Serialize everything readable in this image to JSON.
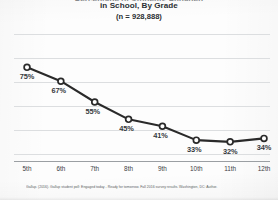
{
  "chart_data": {
    "type": "line",
    "title": "Percentage of Students Engaged in School, By Grade",
    "title_line_1": "Percentage of Students Engaged",
    "title_line_2": "in School, By Grade",
    "subtitle": "(n = 928,888)",
    "categories": [
      "5th",
      "6th",
      "7th",
      "8th",
      "9th",
      "10th",
      "11th",
      "12th"
    ],
    "values": [
      75,
      67,
      55,
      45,
      41,
      33,
      32,
      34
    ],
    "point_labels": [
      "75%",
      "67%",
      "55%",
      "45%",
      "41%",
      "33%",
      "32%",
      "34%"
    ],
    "xlabel": "",
    "ylabel": "",
    "ylim": [
      25,
      85
    ],
    "grid": true,
    "gridline_count": 6,
    "legend": "none",
    "series_color": "#2a2a2a",
    "marker": "open-circle",
    "source_note": "Gallup. (2016). Gallup student poll: Engaged today - Ready for tomorrow. Fall 2016 survey results. Washington, DC: Author."
  },
  "colors": {
    "background": "#fdfdfd",
    "line": "#2a2a2a",
    "marker_fill": "#ffffff",
    "gridline": "#dcdee0",
    "axis": "#9b9fa3",
    "text": "#2b2f33",
    "muted_text": "#5a5e62"
  }
}
